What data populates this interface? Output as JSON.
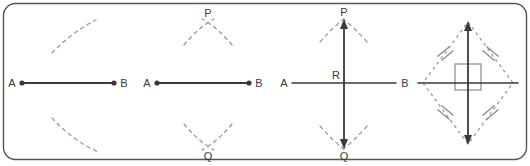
{
  "figure": {
    "border_color": "#555555",
    "line_color": "#3a3a3a",
    "dash_color": "#9a9aa0",
    "tick_color": "#8a8a90",
    "label_color": "#3a3a3a",
    "background": "#ffffff"
  },
  "panels": [
    {
      "id": "step-1",
      "caption": "Arcs drawn from endpoint A above and below segment AB",
      "segment": {
        "label_start": "A",
        "label_end": "B",
        "endpoint_dots": true
      },
      "arcs": [
        {
          "name": "arc-upper",
          "position": "above"
        },
        {
          "name": "arc-lower",
          "position": "below"
        }
      ],
      "labels": [
        "A",
        "B"
      ]
    },
    {
      "id": "step-2",
      "caption": "Arcs from A and B intersect at P above and Q below",
      "segment": {
        "label_start": "A",
        "label_end": "B",
        "endpoint_dots": true
      },
      "intersection_upper": "P",
      "intersection_lower": "Q",
      "labels": [
        "A",
        "B",
        "P",
        "Q"
      ]
    },
    {
      "id": "step-3",
      "caption": "Line PQ drawn through the intersections meets AB at R",
      "segment": {
        "label_start": "A",
        "label_end": "B",
        "endpoint_dots": false
      },
      "bisector": {
        "label_top": "P",
        "label_bottom": "Q",
        "midpoint_label": "R",
        "arrow_top": true,
        "arrow_bottom": true
      },
      "labels": [
        "A",
        "B",
        "P",
        "Q",
        "R"
      ]
    },
    {
      "id": "step-4",
      "caption": "Rhombus APBQ: equal sides marked, diagonals meet at right angles",
      "rhombus": {
        "side_tick_marks": 2,
        "tick_count_label": "||",
        "right_angle_marker": true
      },
      "diagonals": [
        "horizontal",
        "vertical"
      ],
      "labels": []
    }
  ]
}
